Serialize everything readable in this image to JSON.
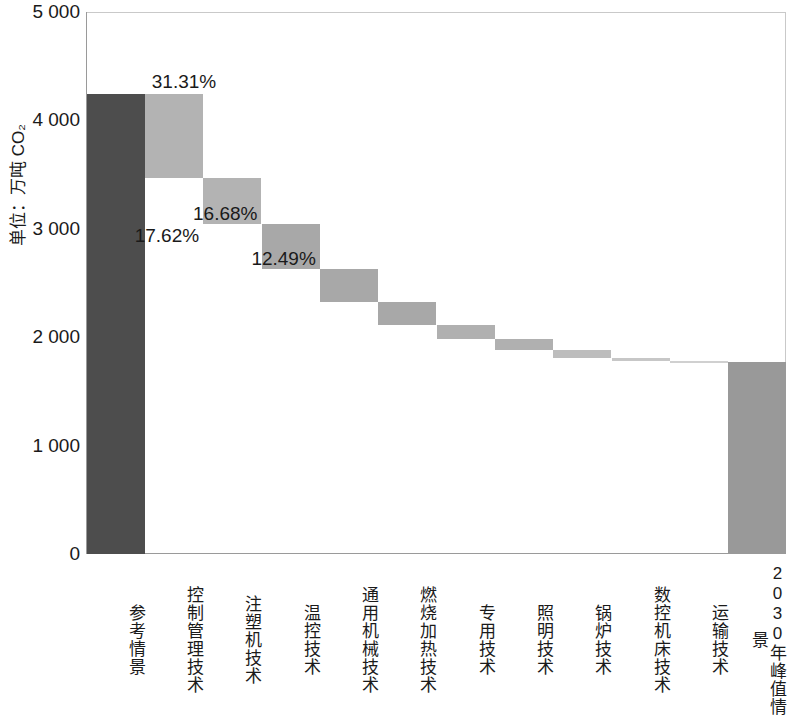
{
  "chart_data": {
    "type": "bar",
    "subtype": "waterfall",
    "title": "",
    "xlabel": "",
    "ylabel": "单位：万吨 CO₂",
    "ylim": [
      0,
      5000
    ],
    "yticks": [
      0,
      1000,
      2000,
      3000,
      4000,
      5000
    ],
    "ytick_labels": [
      "0",
      "1 000",
      "2 000",
      "3 000",
      "4 000",
      "5 000"
    ],
    "grid": false,
    "legend": null,
    "categories": [
      "参考情景",
      "控制管理技术",
      "注塑机技术",
      "温控技术",
      "通用机械技术",
      "燃烧加热技术",
      "专用技术",
      "照明技术",
      "锅炉技术",
      "数控机床技术",
      "运输技术",
      "2030 年峰值情景"
    ],
    "bars": [
      {
        "category": "参考情景",
        "kind": "total",
        "base": 0,
        "top": 4240,
        "value": 4240,
        "color": "#4d4d4d",
        "pct": null,
        "pct_shown": false
      },
      {
        "category": "控制管理技术",
        "kind": "decrease",
        "base": 3470,
        "top": 4240,
        "value": 770,
        "color": "#b3b3b3",
        "pct": "31.31%",
        "pct_shown": true
      },
      {
        "category": "注塑机技术",
        "kind": "decrease",
        "base": 3040,
        "top": 3470,
        "value": 430,
        "color": "#b3b3b3",
        "pct": "17.62%",
        "pct_shown": true
      },
      {
        "category": "温控技术",
        "kind": "decrease",
        "base": 2630,
        "top": 3040,
        "value": 410,
        "color": "#a8a8a8",
        "pct": "16.68%",
        "pct_shown": true
      },
      {
        "category": "通用机械技术",
        "kind": "decrease",
        "base": 2325,
        "top": 2630,
        "value": 305,
        "color": "#a8a8a8",
        "pct": "12.49%",
        "pct_shown": true
      },
      {
        "category": "燃烧加热技术",
        "kind": "decrease",
        "base": 2110,
        "top": 2325,
        "value": 215,
        "color": "#a8a8a8",
        "pct": null,
        "pct_shown": false
      },
      {
        "category": "专用技术",
        "kind": "decrease",
        "base": 1985,
        "top": 2110,
        "value": 125,
        "color": "#b0b0b0",
        "pct": null,
        "pct_shown": false
      },
      {
        "category": "照明技术",
        "kind": "decrease",
        "base": 1880,
        "top": 1985,
        "value": 105,
        "color": "#b0b0b0",
        "pct": null,
        "pct_shown": false
      },
      {
        "category": "锅炉技术",
        "kind": "decrease",
        "base": 1810,
        "top": 1880,
        "value": 70,
        "color": "#bdbdbd",
        "pct": null,
        "pct_shown": false
      },
      {
        "category": "数控机床技术",
        "kind": "decrease",
        "base": 1780,
        "top": 1810,
        "value": 30,
        "color": "#c7c7c7",
        "pct": null,
        "pct_shown": false
      },
      {
        "category": "运输技术",
        "kind": "decrease",
        "base": 1775,
        "top": 1780,
        "value": 5,
        "color": "#d0d0d0",
        "pct": null,
        "pct_shown": false
      },
      {
        "category": "2030 年峰值情景",
        "kind": "total",
        "base": 0,
        "top": 1775,
        "value": 1775,
        "color": "#999999",
        "pct": null,
        "pct_shown": false
      }
    ],
    "labeled_percentages": [
      "31.31%",
      "17.62%",
      "16.68%",
      "12.49%"
    ],
    "colors": {
      "total_first": "#4d4d4d",
      "total_last": "#999999",
      "decrease": "#b0b0b0",
      "axis": "#9a9a9a",
      "text": "#1a1a1a"
    }
  }
}
